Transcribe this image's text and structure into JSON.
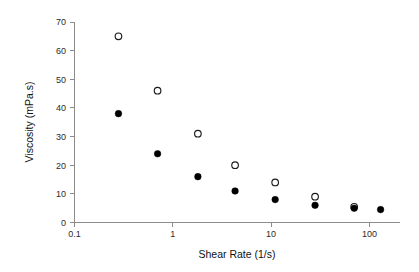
{
  "chart_data": {
    "type": "scatter",
    "title": "",
    "xlabel": "Shear Rate (1/s)",
    "ylabel": "Viscosity (mPa.s)",
    "xscale": "log",
    "yscale": "linear",
    "xlim": [
      0.1,
      200
    ],
    "ylim": [
      0,
      70
    ],
    "xticks": [
      0.1,
      1,
      10,
      100
    ],
    "xticklabels": [
      "0.1",
      "1",
      "10",
      "100"
    ],
    "yticks": [
      0,
      10,
      20,
      30,
      40,
      50,
      60,
      70
    ],
    "yticklabels": [
      "0",
      "10",
      "20",
      "30",
      "40",
      "50",
      "60",
      "70"
    ],
    "grid": false,
    "legend": "none",
    "series": [
      {
        "name": "open-circles",
        "marker": "open circle",
        "color": "#1a1a1a",
        "x": [
          0.28,
          0.7,
          1.8,
          4.3,
          11,
          28,
          70
        ],
        "y": [
          65,
          46,
          31,
          20,
          14,
          9,
          5.5
        ]
      },
      {
        "name": "filled-circles",
        "marker": "filled circle",
        "color": "#000000",
        "x": [
          0.28,
          0.7,
          1.8,
          4.3,
          11,
          28,
          70,
          130
        ],
        "y": [
          38,
          24,
          16,
          11,
          8,
          6,
          5,
          4.5
        ]
      }
    ]
  },
  "axis": {
    "x_title": "Shear Rate (1/s)",
    "y_title": "Viscosity (mPa.s)",
    "x_tick_labels": [
      "0.1",
      "1",
      "10",
      "100"
    ],
    "y_tick_labels": [
      "0",
      "10",
      "20",
      "30",
      "40",
      "50",
      "60",
      "70"
    ]
  },
  "colors": {
    "axis": "#8c8c8c",
    "marker": "#000000",
    "background": "#ffffff",
    "text": "#1a1a1a"
  }
}
